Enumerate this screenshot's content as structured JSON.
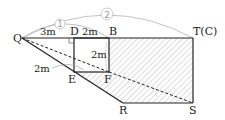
{
  "diagram": {
    "points": {
      "Q": {
        "label": "Q",
        "x": 22,
        "y": 38
      },
      "D": {
        "label": "D",
        "x": 74,
        "y": 38
      },
      "B": {
        "label": "B",
        "x": 109,
        "y": 38
      },
      "T": {
        "label": "T(C)",
        "x": 193,
        "y": 38
      },
      "E": {
        "label": "E",
        "x": 74,
        "y": 72
      },
      "F": {
        "label": "F",
        "x": 109,
        "y": 72
      },
      "R": {
        "label": "R",
        "x": 123,
        "y": 103
      },
      "S": {
        "label": "S",
        "x": 193,
        "y": 103
      }
    },
    "measurements": {
      "QD": "3m",
      "DB": "2m",
      "BF": "2m",
      "QE": "2m"
    },
    "arcs": {
      "small": "1",
      "large": "2"
    },
    "colors": {
      "line": "#222222",
      "arc": "#bbbbbb",
      "hatch": "#999999"
    }
  }
}
